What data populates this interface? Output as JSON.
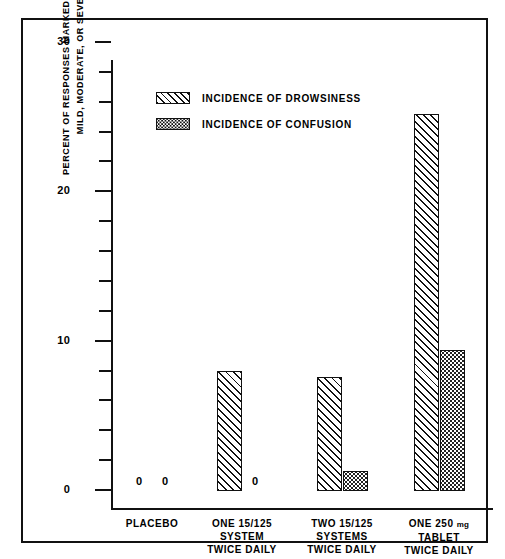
{
  "chart_data": {
    "type": "bar",
    "title": "",
    "xlabel": "",
    "ylabel": "PERCENT OF RESPONSES MARKED AS EITHER MILD, MODERATE, OR SEVERE",
    "ylabel_line1": "PERCENT OF RESPONSES MARKED AS EITHER",
    "ylabel_line2": "MILD, MODERATE, OR SEVERE",
    "ylim": [
      0,
      30
    ],
    "y_major_ticks": [
      0,
      10,
      20,
      30
    ],
    "y_minor_tick_step": 2,
    "grid": false,
    "legend_position": "top-center",
    "categories": [
      "PLACEBO",
      "ONE 15/125 SYSTEM TWICE DAILY",
      "TWO 15/125 SYSTEMS TWICE DAILY",
      "ONE 250 mg TABLET TWICE DAILY"
    ],
    "category_lines": [
      [
        "PLACEBO"
      ],
      [
        "ONE 15/125",
        "SYSTEM",
        "TWICE DAILY"
      ],
      [
        "TWO 15/125",
        "SYSTEMS",
        "TWICE DAILY"
      ],
      [
        "ONE 250 mg",
        "TABLET",
        "TWICE DAILY"
      ]
    ],
    "series": [
      {
        "name": "INCIDENCE OF DROWSINESS",
        "pattern": "diagonal-hatch",
        "values": [
          0,
          8.0,
          7.6,
          25.2
        ]
      },
      {
        "name": "INCIDENCE OF CONFUSION",
        "pattern": "stipple-dots",
        "values": [
          0,
          0,
          1.3,
          9.4
        ]
      }
    ],
    "zero_annotations": [
      {
        "label": "0",
        "category": "PLACEBO",
        "series": "INCIDENCE OF DROWSINESS"
      },
      {
        "label": "0",
        "category": "PLACEBO",
        "series": "INCIDENCE OF CONFUSION"
      },
      {
        "label": "0",
        "category": "ONE 15/125 SYSTEM TWICE DAILY",
        "series": "INCIDENCE OF CONFUSION"
      }
    ]
  },
  "axis": {
    "tick_labels": [
      "30",
      "20",
      "10",
      "0"
    ]
  },
  "legend": {
    "items": [
      {
        "label": "INCIDENCE OF DROWSINESS",
        "pattern": "diagonal-hatch"
      },
      {
        "label": "INCIDENCE OF CONFUSION",
        "pattern": "stipple-dots"
      }
    ]
  },
  "colors": {
    "ink": "#111111",
    "background": "#ffffff"
  }
}
